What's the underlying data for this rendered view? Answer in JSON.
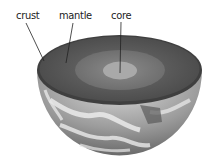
{
  "diagram": {
    "labels": {
      "crust": "crust",
      "mantle": "mantle",
      "core": "core"
    },
    "colors": {
      "crust_surface": "#4a4a4a",
      "mantle": "#5f5f5f",
      "outer_zone": "#7a7a7a",
      "core": "#a8a8a8",
      "globe": "#9a9a9a",
      "leader_line": "#222222"
    }
  }
}
